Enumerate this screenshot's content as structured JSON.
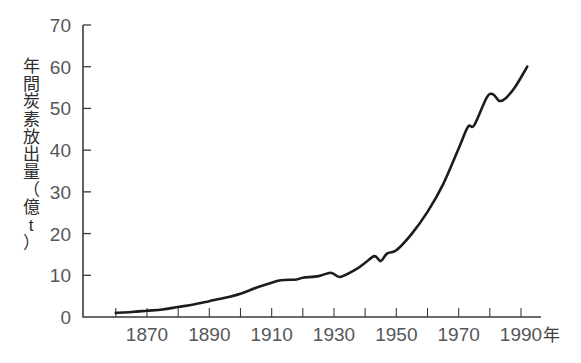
{
  "chart_data": {
    "type": "line",
    "title": "",
    "subtitle": "",
    "xlabel": "年",
    "ylabel": "年間炭素放出量（億t）",
    "xlim": [
      1860,
      1992
    ],
    "ylim": [
      0,
      70
    ],
    "grid": false,
    "legend": null,
    "xticks": [
      1870,
      1890,
      1910,
      1930,
      1950,
      1970,
      1990
    ],
    "xtick_labels": [
      "1870",
      "1890",
      "1910",
      "1930",
      "1950",
      "1970",
      "1990"
    ],
    "xminor_tick_step": 10,
    "yticks": [
      0,
      10,
      20,
      30,
      40,
      50,
      60,
      70
    ],
    "ytick_labels": [
      "0",
      "10",
      "20",
      "30",
      "40",
      "50",
      "60",
      "70"
    ],
    "series": [
      {
        "name": "年間炭素放出量",
        "color": "#1c1c1c",
        "x": [
          1860,
          1865,
          1870,
          1875,
          1880,
          1885,
          1890,
          1895,
          1900,
          1905,
          1910,
          1913,
          1918,
          1920,
          1925,
          1929,
          1932,
          1937,
          1940,
          1943,
          1945,
          1947,
          1950,
          1955,
          1960,
          1965,
          1970,
          1973,
          1975,
          1979,
          1981,
          1983,
          1985,
          1988,
          1992
        ],
        "y": [
          1.0,
          1.2,
          1.5,
          1.8,
          2.4,
          3.0,
          3.8,
          4.6,
          5.6,
          7.0,
          8.2,
          8.8,
          9.0,
          9.4,
          9.8,
          10.6,
          9.6,
          11.4,
          13.0,
          14.6,
          13.4,
          15.2,
          16.0,
          20.0,
          25.2,
          31.8,
          40.4,
          45.6,
          46.0,
          52.6,
          53.4,
          51.8,
          52.4,
          55.0,
          60.0
        ]
      }
    ],
    "annotations": []
  },
  "axis": {
    "y_unit_note": "億t",
    "x_unit_label": "年"
  },
  "ylabel_chars": [
    "年",
    "間",
    "炭",
    "素",
    "放",
    "出",
    "量",
    "（",
    "億",
    "t",
    "）"
  ],
  "colors": {
    "curve": "#1c1c1c",
    "axis": "#3b3b3b",
    "tick_text": "#56565a",
    "background": "#ffffff"
  }
}
